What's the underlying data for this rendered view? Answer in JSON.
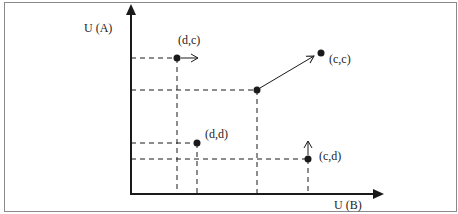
{
  "diagram": {
    "type": "utility-space-plot",
    "axes": {
      "y_label": "U (A)",
      "x_label": "U (B)"
    },
    "points": [
      {
        "id": "dc",
        "label": "(d,c)",
        "x": 177,
        "y": 58,
        "arrow": "right"
      },
      {
        "id": "cc",
        "label": "(c,c)",
        "x": 321,
        "y": 53,
        "arrow": "none"
      },
      {
        "id": "mid",
        "label": "",
        "x": 257,
        "y": 90,
        "arrow": "to-cc"
      },
      {
        "id": "dd",
        "label": "(d,d)",
        "x": 197,
        "y": 143,
        "arrow": "none"
      },
      {
        "id": "cd",
        "label": "(c,d)",
        "x": 308,
        "y": 159,
        "arrow": "up"
      }
    ],
    "colors": {
      "border": "#8a8a8a",
      "ink": "#1a1a1a",
      "background": "#ffffff"
    }
  }
}
